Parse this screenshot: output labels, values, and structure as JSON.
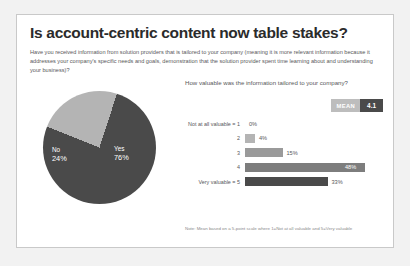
{
  "slide": {
    "title": "Is account-centric content now table stakes?",
    "subtitle": "Have you received information from solution providers that is tailored to your company (meaning it is more relevant information because it addresses your company's specific needs and goals, demonstration that the solution provider spent time learning about and understanding your business)?",
    "note": "Note: Mean based on a 5-point scale where 1=Not at all valuable and 5=Very valuable"
  },
  "colors": {
    "dark": "#4a4a4a",
    "light": "#b4b4b4",
    "mid": "#8f8f8f",
    "badge_label_bg": "#bdbdbd",
    "badge_value_bg": "#4a4a4a",
    "text": "#58585a",
    "title": "#2b2b2b"
  },
  "mean": {
    "label": "MEAN",
    "value": "4.1"
  },
  "bar_question": "How valuable was the information tailored to your company?",
  "chart_data": [
    {
      "type": "pie",
      "title": "",
      "categories": [
        "Yes",
        "No"
      ],
      "values": [
        76,
        24
      ],
      "labels": [
        "76%",
        "24%"
      ],
      "colors": [
        "#4a4a4a",
        "#b4b4b4"
      ],
      "legend": "none"
    },
    {
      "type": "bar",
      "orientation": "horizontal",
      "title": "How valuable was the information tailored to your company?",
      "categories": [
        "Not at all valuable = 1",
        "2",
        "3",
        "4",
        "Very valuable = 5"
      ],
      "values": [
        0,
        4,
        15,
        48,
        33
      ],
      "labels": [
        "0%",
        "4%",
        "15%",
        "48%",
        "33%"
      ],
      "xlabel": "",
      "ylabel": "",
      "xlim": [
        0,
        50
      ],
      "grid": false,
      "legend": "none",
      "bar_colors": [
        "#c9c9c9",
        "#b4b4b4",
        "#9a9a9a",
        "#7d7d7d",
        "#4a4a4a"
      ],
      "label_position": [
        "outside",
        "outside",
        "outside",
        "inside",
        "outside"
      ]
    }
  ]
}
